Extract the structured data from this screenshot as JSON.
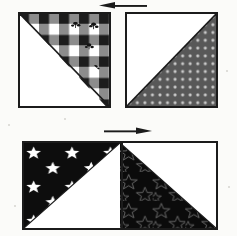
{
  "figure": {
    "background_color": "#fbfbf9",
    "ink_color": "#1b1b1b",
    "width": 237,
    "height": 236
  },
  "rows": [
    {
      "id": "row-top",
      "arrow": {
        "name": "pressing-arrow-left",
        "direction": "left",
        "label": "",
        "x": 99,
        "y": 2,
        "width": 48,
        "height": 11,
        "color": "#1b1b1b"
      },
      "units": [
        {
          "id": "unit-top-left",
          "name": "hst-unit-gingham",
          "x": 18,
          "y": 12,
          "size": 93,
          "fabric": {
            "name": "gingham-floral",
            "type": "gingham",
            "colors": {
              "light": "#ffffff",
              "mid": "#8c8c8c",
              "dark": "#1c1c1c",
              "motif": "#141414"
            },
            "cell": 11,
            "motif_count": 7
          },
          "triangle_position": "upper-right",
          "background": "#ffffff",
          "seam_direction": "tl-br"
        },
        {
          "id": "unit-top-right",
          "name": "hst-unit-dots",
          "x": 125,
          "y": 12,
          "size": 93,
          "fabric": {
            "name": "gray-polka-dot",
            "type": "dots",
            "colors": {
              "ground": "#585858",
              "dot": "#c9c9c9"
            },
            "cell": 8,
            "dot_radius": 1.6
          },
          "triangle_position": "lower-right",
          "background": "#ffffff",
          "seam_direction": "bl-tr"
        }
      ]
    },
    {
      "id": "row-bottom",
      "arrow": {
        "name": "pressing-arrow-right",
        "direction": "right",
        "label": "",
        "x": 104,
        "y": 126,
        "width": 48,
        "height": 11,
        "color": "#1b1b1b"
      },
      "frame": {
        "x": 22,
        "y": 141,
        "width": 196,
        "height": 89
      },
      "units": [
        {
          "id": "unit-bottom-left",
          "name": "hst-unit-white-stars",
          "fabric": {
            "name": "black-with-white-stars",
            "type": "stars-solid",
            "colors": {
              "ground": "#0d0d0d",
              "star": "#ffffff"
            },
            "star_count": 7
          },
          "triangle_position": "upper-left",
          "background": "#ffffff",
          "seam_direction": "bl-tr"
        },
        {
          "id": "unit-bottom-right",
          "name": "hst-unit-outline-stars",
          "fabric": {
            "name": "black-with-star-outlines",
            "type": "stars-outline",
            "colors": {
              "ground": "#0b0b0b",
              "outline": "#6e6e6e"
            },
            "star_count": 12
          },
          "triangle_position": "lower-left",
          "background": "#ffffff",
          "seam_direction": "tl-br"
        }
      ]
    }
  ]
}
